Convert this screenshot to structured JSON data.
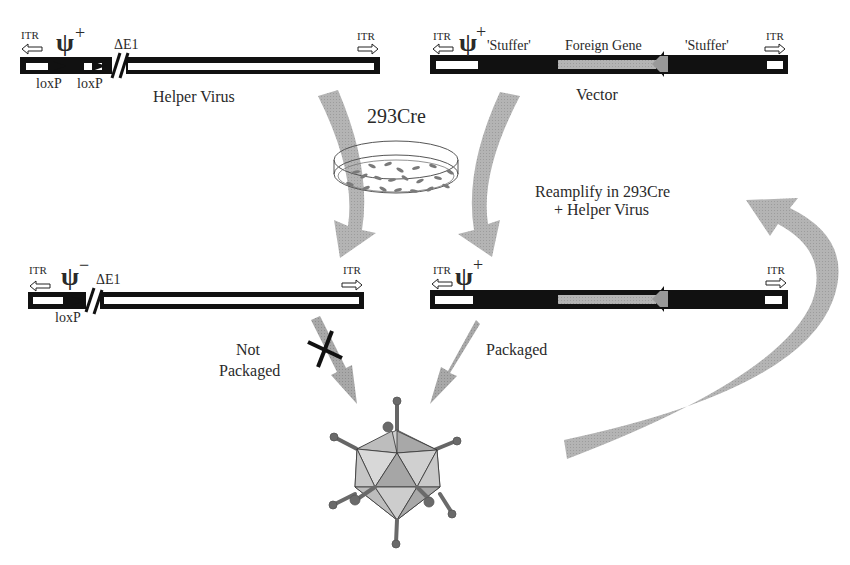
{
  "top_left": {
    "itr_left": "ITR",
    "psi": "ψ",
    "psi_sign": "+",
    "delta_e1": "ΔE1",
    "itr_right": "ITR",
    "loxp_1": "loxP",
    "loxp_2": "loxP",
    "title": "Helper Virus"
  },
  "top_right": {
    "itr_left": "ITR",
    "psi": "ψ",
    "psi_sign": "+",
    "stuffer_left": "'Stuffer'",
    "foreign_gene": "Foreign Gene",
    "stuffer_right": "'Stuffer'",
    "itr_right": "ITR",
    "title": "Vector"
  },
  "center": {
    "cell_line": "293Cre",
    "reamplify_line1": "Reamplify in 293Cre",
    "reamplify_line2": "+ Helper Virus"
  },
  "bottom_left": {
    "itr_left": "ITR",
    "psi": "ψ",
    "psi_sign": "−",
    "delta_e1": "ΔE1",
    "itr_right": "ITR",
    "loxp": "loxP",
    "status_line1": "Not",
    "status_line2": "Packaged"
  },
  "bottom_right": {
    "itr_left": "ITR",
    "psi": "ψ",
    "psi_sign": "+",
    "itr_right": "ITR",
    "status": "Packaged"
  },
  "colors": {
    "black": "#111111",
    "gray_arrow": "#b0b0b0",
    "dark_gray_arrow": "#8a8a8a",
    "gene_gray": "#aaaaaa",
    "capsid_light": "#d4d4d4",
    "capsid_mid": "#b8b8b8",
    "capsid_dark": "#9a9a9a"
  }
}
